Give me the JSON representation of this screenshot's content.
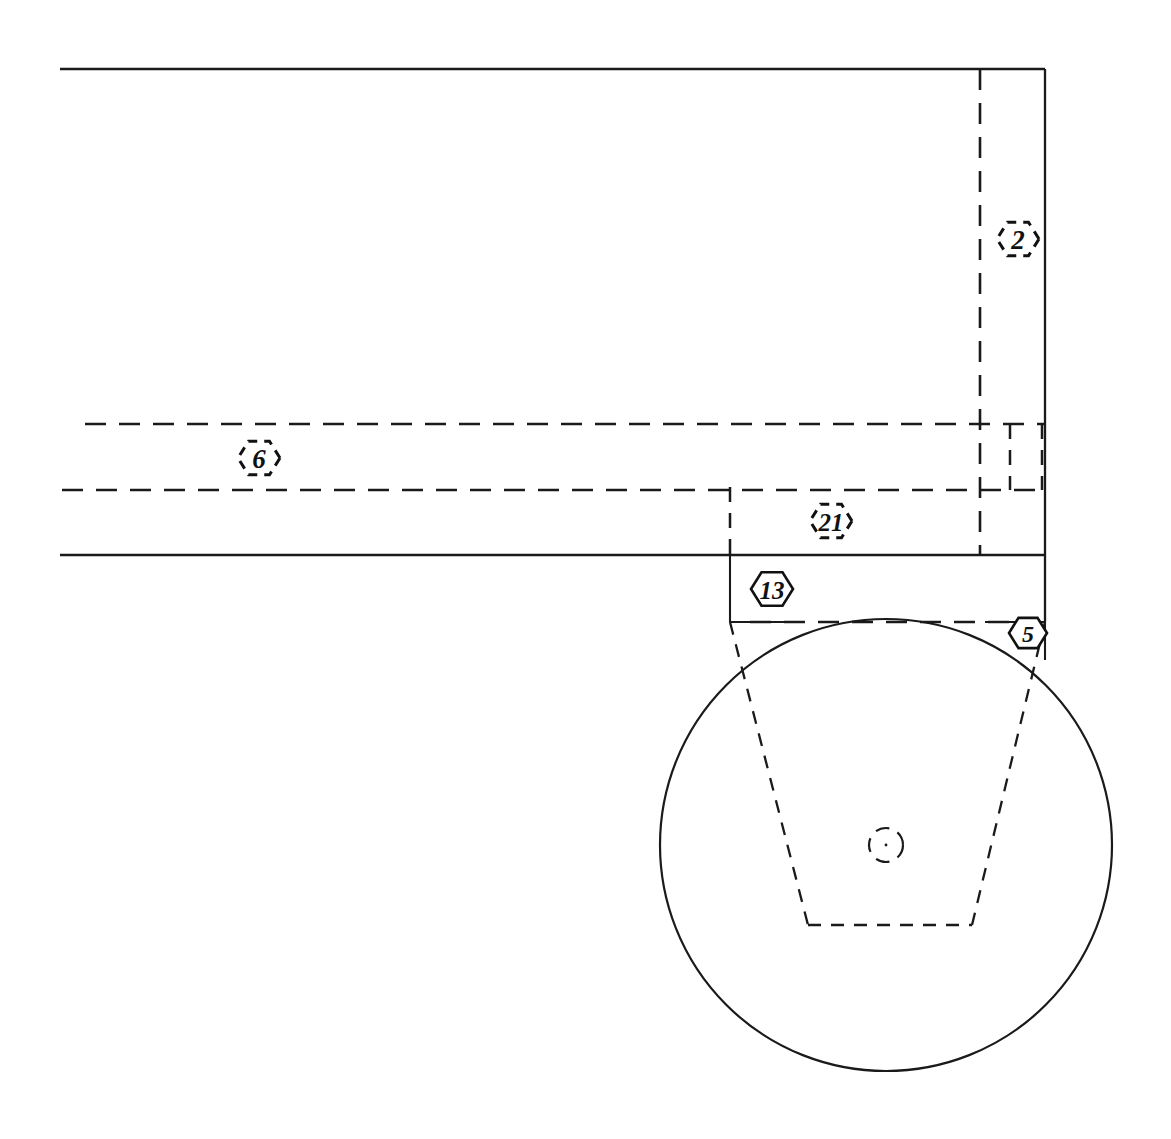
{
  "drawing": {
    "title": "Mechanical Assembly Section View",
    "sheet": {
      "width": 1171,
      "height": 1139,
      "background": "#ffffff",
      "line_color": "#1a1a1a"
    },
    "balloons": [
      {
        "id": "balloon-2",
        "label": "2",
        "style": "dashed-hexagon",
        "cx": 1018,
        "cy": 239,
        "radius": 21,
        "font_size": 27
      },
      {
        "id": "balloon-6",
        "label": "6",
        "style": "dashed-hexagon",
        "cx": 259,
        "cy": 458,
        "radius": 21,
        "font_size": 27
      },
      {
        "id": "balloon-21",
        "label": "21",
        "style": "dashed-hexagon",
        "cx": 831,
        "cy": 521,
        "radius": 21,
        "font_size": 25
      },
      {
        "id": "balloon-13",
        "label": "13",
        "style": "solid-hexagon",
        "cx": 772,
        "cy": 589,
        "radius": 21,
        "font_size": 25
      },
      {
        "id": "balloon-5",
        "label": "5",
        "style": "solid-hexagon",
        "cx": 1028,
        "cy": 633,
        "radius": 19,
        "font_size": 24
      }
    ],
    "geometry": {
      "body_outline": {
        "top_edge_y": 69,
        "left_x": 60,
        "right_x": 1045,
        "mid_edge_y": 555,
        "step_y": 622
      },
      "wheel": {
        "center_x": 886,
        "center_y": 845,
        "radius": 226,
        "hub_radius": 17
      },
      "hub_taper": {
        "top_left_x": 730,
        "top_right_x": 1045,
        "top_y": 622,
        "bottom_left_x": 808,
        "bottom_right_x": 972,
        "bottom_y": 925
      },
      "hidden_band": {
        "upper_y": 424,
        "lower_y": 490,
        "left_start_x": 85,
        "left_start_x_lower": 62
      },
      "vertical_hidden_lines": [
        {
          "x": 980,
          "y1": 69,
          "y2": 555
        },
        {
          "x": 730,
          "y1": 487,
          "y2": 555
        },
        {
          "x": 1010,
          "y1": 424,
          "y2": 490
        },
        {
          "x": 1045,
          "y1": 424,
          "y2": 490
        }
      ]
    },
    "notes": {
      "view_type": "section",
      "line_types": [
        "visible-solid",
        "hidden-dashed",
        "center-line"
      ]
    }
  }
}
